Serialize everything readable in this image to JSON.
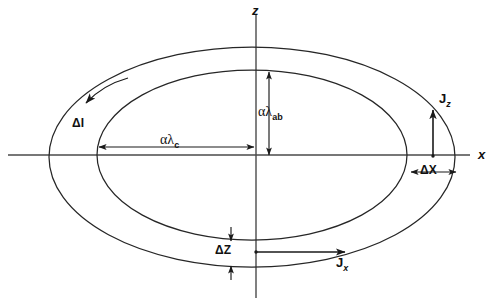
{
  "figure": {
    "type": "technical-diagram",
    "background_color": "#ffffff",
    "line_color": "#262626",
    "axis_color": "#4a4a4a"
  },
  "axes": {
    "horizontal": {
      "name": "x-axis",
      "label": "x",
      "y_position": 155,
      "x_start": 8,
      "x_end": 470
    },
    "vertical": {
      "name": "z-axis",
      "label": "z",
      "x_position": 256,
      "y_start": 14,
      "y_end": 298
    },
    "origin": {
      "x": 256,
      "y": 155
    }
  },
  "ellipses": [
    {
      "name": "outer-ellipse",
      "cx": 252,
      "cy": 157,
      "rx": 203,
      "ry": 110
    },
    {
      "name": "inner-ellipse",
      "cx": 252,
      "cy": 155,
      "rx": 155,
      "ry": 85
    }
  ],
  "dimensions": [
    {
      "name": "alpha-lambda-c",
      "label_main": "αλ",
      "label_sub": "c",
      "orientation": "horizontal",
      "from": {
        "x": 98,
        "y": 147
      },
      "to": {
        "x": 255,
        "y": 147
      },
      "label_x": 160,
      "label_y": 134,
      "description": "semi-axis of inner ellipse along x"
    },
    {
      "name": "alpha-lambda-ab",
      "label_main": "αλ",
      "label_sub": "ab",
      "orientation": "vertical",
      "from": {
        "x": 269,
        "y": 71
      },
      "to": {
        "x": 269,
        "y": 156
      },
      "label_x": 259,
      "label_y": 107,
      "description": "semi-axis of inner ellipse along z"
    },
    {
      "name": "delta-x",
      "label": "ΔX",
      "orientation": "horizontal",
      "from": {
        "x": 410,
        "y": 172
      },
      "to": {
        "x": 457,
        "y": 172
      },
      "label_x": 421,
      "label_y": 165,
      "description": "radial gap between inner and outer ellipse on x-axis"
    },
    {
      "name": "delta-z",
      "label": "ΔZ",
      "orientation": "vertical",
      "from": {
        "x": 231,
        "y": 226
      },
      "to": {
        "x": 231,
        "y": 280
      },
      "label_x": 216,
      "label_y": 245,
      "description": "vertical gap between inner and outer ellipse on z-axis"
    }
  ],
  "currents": [
    {
      "name": "current-jz",
      "label_main": "J",
      "label_sub": "z",
      "direction": "up",
      "from": {
        "x": 433,
        "y": 156
      },
      "to": {
        "x": 433,
        "y": 108
      },
      "label_x": 440,
      "label_y": 95
    },
    {
      "name": "current-jx",
      "label_main": "J",
      "label_sub": "x",
      "direction": "right",
      "from": {
        "x": 256,
        "y": 252
      },
      "to": {
        "x": 348,
        "y": 252
      },
      "label_x": 337,
      "label_y": 258
    },
    {
      "name": "current-delta-i",
      "label": "ΔI",
      "direction": "counter-clockwise-arc",
      "label_x": 74,
      "label_y": 119
    }
  ]
}
